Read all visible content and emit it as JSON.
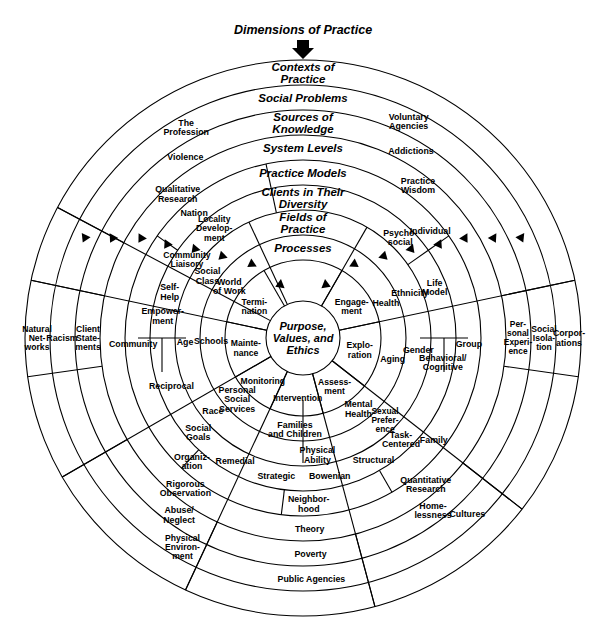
{
  "title": "Dimensions of Practice",
  "center": {
    "lines": [
      "Purpose,",
      "Values, and",
      "Ethics"
    ]
  },
  "band_labels": [
    {
      "id": "contexts-of-practice",
      "lines": [
        "Contexts of",
        "Practice"
      ]
    },
    {
      "id": "social-problems",
      "lines": [
        "Social Problems"
      ]
    },
    {
      "id": "sources-of-knowledge",
      "lines": [
        "Sources of",
        "Knowledge"
      ]
    },
    {
      "id": "system-levels",
      "lines": [
        "System Levels"
      ]
    },
    {
      "id": "practice-models",
      "lines": [
        "Practice Models"
      ]
    },
    {
      "id": "clients-in-their-diversity",
      "lines": [
        "Clients in Their",
        "Diversity"
      ]
    },
    {
      "id": "fields-of-practice",
      "lines": [
        "Fields of",
        "Practice"
      ]
    },
    {
      "id": "processes",
      "lines": [
        "Processes"
      ]
    }
  ],
  "rings": [
    {
      "id": "processes",
      "band": "Processes",
      "cells": [
        {
          "lines": [
            "Engage-",
            "ment"
          ]
        },
        {
          "lines": [
            "Explo-",
            "ration"
          ]
        },
        {
          "lines": [
            "Assess-",
            "ment"
          ]
        },
        {
          "lines": [
            "Intervention"
          ]
        },
        {
          "lines": [
            "Monitoring"
          ]
        },
        {
          "lines": [
            "Mainte-",
            "nance"
          ]
        },
        {
          "lines": [
            "Termi-",
            "nation"
          ]
        }
      ]
    },
    {
      "id": "fields-of-practice",
      "band": "Fields of Practice",
      "cells": [
        {
          "lines": [
            "Health"
          ]
        },
        {
          "lines": [
            "Aging"
          ]
        },
        {
          "lines": [
            "Mental",
            "Health"
          ]
        },
        {
          "lines": [
            "Families",
            "and Children"
          ]
        },
        {
          "lines": [
            "Personal",
            "Social",
            "Services"
          ]
        },
        {
          "lines": [
            "Schools"
          ]
        },
        {
          "lines": [
            "World",
            "of Work"
          ]
        }
      ]
    },
    {
      "id": "clients-in-their-diversity",
      "band": "Clients in Their Diversity",
      "cells": [
        {
          "lines": [
            "Ethnicity"
          ]
        },
        {
          "lines": [
            "Gender"
          ]
        },
        {
          "lines": [
            "Sexual",
            "Prefer-",
            "ence"
          ]
        },
        {
          "lines": [
            "Physical",
            "Ability"
          ]
        },
        {
          "lines": [
            "Race"
          ]
        },
        {
          "lines": [
            "Age"
          ]
        },
        {
          "lines": [
            "Social",
            "Class"
          ]
        }
      ]
    },
    {
      "id": "practice-models",
      "band": "Practice Models",
      "cells": [
        {
          "lines": [
            "Psycho-",
            "social"
          ]
        },
        {
          "lines": [
            "Life",
            "Model"
          ]
        },
        {
          "lines": [
            "Behavioral/",
            "Cognitive"
          ]
        },
        {
          "lines": [
            "Task-",
            "Centered"
          ]
        },
        {
          "lines": [
            "Structural"
          ]
        },
        {
          "lines": [
            "Bowenian"
          ]
        },
        {
          "lines": [
            "Strategic"
          ]
        },
        {
          "lines": [
            "Remedial"
          ]
        },
        {
          "lines": [
            "Social",
            "Goals"
          ]
        },
        {
          "lines": [
            "Reciprocal"
          ]
        },
        {
          "lines": [
            "Self-",
            "Help"
          ]
        },
        {
          "lines": [
            "Empower-",
            "ment"
          ]
        },
        {
          "lines": [
            "Locality",
            "Develop-",
            "ment"
          ]
        },
        {
          "lines": [
            "Community",
            "Liaisory"
          ]
        }
      ]
    },
    {
      "id": "system-levels",
      "band": "System Levels",
      "cells": [
        {
          "lines": [
            "Individual"
          ]
        },
        {
          "lines": [
            "Group"
          ]
        },
        {
          "lines": [
            "Family"
          ]
        },
        {
          "lines": [
            "Neighbor-",
            "hood"
          ]
        },
        {
          "lines": [
            "Organiz-",
            "ation"
          ]
        },
        {
          "lines": [
            "Community"
          ]
        },
        {
          "lines": [
            "Nation"
          ]
        }
      ]
    },
    {
      "id": "sources-of-knowledge",
      "band": "Sources of Knowledge",
      "cells": [
        {
          "lines": [
            "Practice",
            "Wisdom"
          ]
        },
        {
          "lines": [
            "Quantitative",
            "Research"
          ]
        },
        {
          "lines": [
            "Theory"
          ]
        },
        {
          "lines": [
            "Rigorous",
            "Observation"
          ]
        },
        {
          "lines": [
            "Qualitative",
            "Research"
          ]
        }
      ]
    },
    {
      "id": "social-problems",
      "band": "Social Problems",
      "cells": [
        {
          "lines": [
            "Addictions"
          ]
        },
        {
          "lines": [
            "Home-",
            "lessness"
          ]
        },
        {
          "lines": [
            "Poverty"
          ]
        },
        {
          "lines": [
            "Abuse/",
            "Neglect"
          ]
        },
        {
          "lines": [
            "Violence"
          ]
        }
      ]
    },
    {
      "id": "contexts-of-practice",
      "band": "Contexts of Practice",
      "cells": [
        {
          "lines": [
            "Voluntary",
            "Agencies"
          ]
        },
        {
          "lines": [
            "Cultures"
          ]
        },
        {
          "lines": [
            "Public Agencies"
          ]
        },
        {
          "lines": [
            "Physical",
            "Environ-",
            "ment"
          ]
        },
        {
          "lines": [
            "The",
            "Profession"
          ]
        }
      ]
    },
    {
      "id": "outer-contexts",
      "band": "Contexts of Practice (outer)",
      "cells": [
        {
          "lines": [
            "Corpor-",
            "ations"
          ]
        },
        {
          "lines": [
            "Natural",
            "Net-",
            "works"
          ]
        }
      ]
    },
    {
      "id": "outer-contexts-2",
      "band": "Contexts of Practice (outer 2)",
      "cells": [
        {
          "lines": [
            "Social",
            "Isola-",
            "tion"
          ]
        },
        {
          "lines": [
            "Racism"
          ]
        }
      ]
    },
    {
      "id": "outer-contexts-3",
      "band": "Contexts of Practice (outer 3)",
      "cells": [
        {
          "lines": [
            "Per-",
            "sonal",
            "Experi-",
            "ence"
          ]
        },
        {
          "lines": [
            "Client",
            "State-",
            "ments"
          ]
        }
      ]
    }
  ],
  "colors": {
    "stroke": "#000000",
    "background": "#ffffff"
  }
}
